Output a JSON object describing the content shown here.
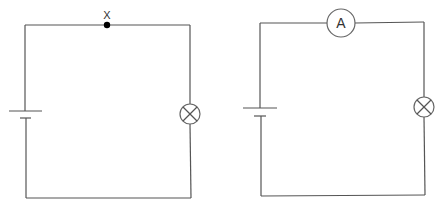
{
  "figure": {
    "colors": {
      "wire": "#555555",
      "background": "#ffffff",
      "dot": "#000000"
    }
  },
  "circuits": [
    {
      "id": "left",
      "components": [
        {
          "type": "cell",
          "symbol": "battery-icon"
        },
        {
          "type": "lamp",
          "symbol": "lamp-icon"
        },
        {
          "type": "point",
          "label": "X"
        }
      ],
      "point_label": "X"
    },
    {
      "id": "right",
      "components": [
        {
          "type": "cell",
          "symbol": "battery-icon"
        },
        {
          "type": "ammeter",
          "label": "A"
        },
        {
          "type": "lamp",
          "symbol": "lamp-icon"
        }
      ],
      "ammeter_label": "A"
    }
  ]
}
